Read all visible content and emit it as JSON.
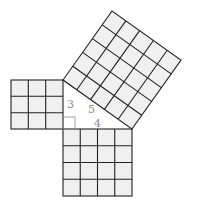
{
  "diagram": {
    "fill_color": "#f0f0f0",
    "line_color": "#222222",
    "labels": {
      "leg_a": "3",
      "hypotenuse": "5",
      "leg_b": "4"
    },
    "squares": [
      {
        "name": "square-side-3",
        "grid": 3
      },
      {
        "name": "square-side-4",
        "grid": 4
      },
      {
        "name": "square-side-5",
        "grid": 5
      }
    ]
  }
}
